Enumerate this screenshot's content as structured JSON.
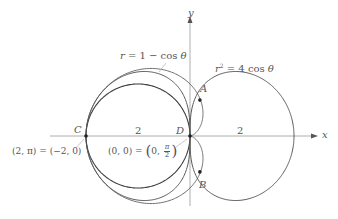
{
  "figure": {
    "width": 338,
    "height": 219,
    "origin_px": [
      190,
      136
    ],
    "unit_px": 52,
    "colors": {
      "axis": "#9a9a9a",
      "circle": "#3a3a3a",
      "cardioid": "#6e6e6e",
      "lemniscate": "#5a5a5a",
      "point": "#222222",
      "text": "#555555",
      "leader": "#b0b0b0"
    }
  },
  "axes": {
    "x_label": "x",
    "y_label": "y",
    "x_range": [
      -2.7,
      2.45
    ],
    "y_range": [
      -1.35,
      2.35
    ]
  },
  "curves": [
    {
      "id": "circle",
      "equation": "r = −2 cos θ",
      "label": ""
    },
    {
      "id": "cardioid",
      "equation": "r = 1 − cos θ",
      "label": "r = 1 − cos θ"
    },
    {
      "id": "lemniscate",
      "equation": "r² = 4 cos θ",
      "label_r": "r",
      "label_exp": "2",
      "label_rest": " = 4 cos θ"
    }
  ],
  "labels": {
    "cardioid_r": "r",
    "cardioid_rest": " = 1 − cos ",
    "cardioid_theta": "θ",
    "lemni_r": "r",
    "lemni_exp": "2",
    "lemni_rest": " = 4 cos ",
    "lemni_theta": "θ",
    "segment_left": "2",
    "segment_right": "2",
    "polar_c_left": "(2, π) = (−2, 0)",
    "polar_d_left": "(0, 0) = ",
    "polar_d_paren_open": "(",
    "polar_d_zero": "0, ",
    "polar_d_pi": "π",
    "polar_d_two": "2",
    "polar_d_paren_close": ")"
  },
  "points": [
    {
      "name": "A",
      "xy": [
        0.19,
        0.69
      ]
    },
    {
      "name": "B",
      "xy": [
        0.19,
        -0.69
      ]
    },
    {
      "name": "C",
      "xy": [
        -2,
        0
      ]
    },
    {
      "name": "D",
      "xy": [
        0,
        0
      ]
    }
  ]
}
